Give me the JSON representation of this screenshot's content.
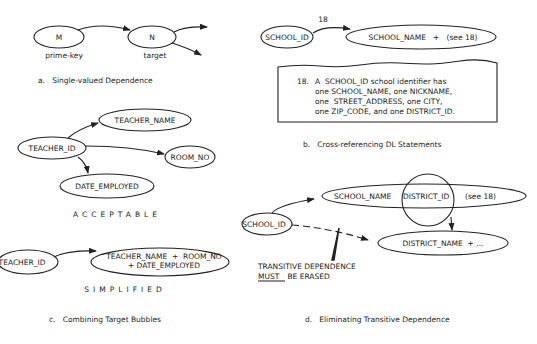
{
  "panel_a": {
    "node_m": "M",
    "node_n": "N",
    "label_m": "prime-key",
    "label_n": "target",
    "caption": "a.   Single-valued Dependence"
  },
  "panel_b": {
    "arrow_label": "18",
    "source": "SCHOOL_ID",
    "target": "SCHOOL_NAME   +   (see 18)",
    "note_number": "18.",
    "note_lines": [
      "A  SCHOOL_ID school identifier has",
      "one SCHOOL_NAME, one NICKNAME,",
      "one  STREET_ADDRESS, one CITY,",
      "one ZIP_CODE, and one DISTRICT_ID."
    ],
    "caption": "b.   Cross-referencing DL Statements"
  },
  "panel_c": {
    "acceptable": {
      "source": "TEACHER_ID",
      "targets": [
        "TEACHER_NAME",
        "ROOM_NO",
        "DATE_EMPLOYED"
      ],
      "label": "ACCEPTABLE"
    },
    "simplified": {
      "source": "TEACHER_ID",
      "target_line1": "TEACHER_NAME  +  ROOM_NO",
      "target_line2": "+ DATE_EMPLOYED",
      "label": "SIMPLIFIED"
    },
    "caption": "c.   Combining Target Bubbles"
  },
  "panel_d": {
    "source": "SCHOOL_ID",
    "target1_part1": "SCHOOL_NAME",
    "target1_circled": "DISTRICT_ID",
    "target1_part2": "(see 18)",
    "target2": "DISTRICT_NAME  + ...",
    "warning_line1": "TRANSITIVE DEPENDENCE",
    "warning_must": "MUST",
    "warning_line2_rest": " BE ERASED",
    "caption": "d.   Eliminating Transitive Dependence"
  }
}
